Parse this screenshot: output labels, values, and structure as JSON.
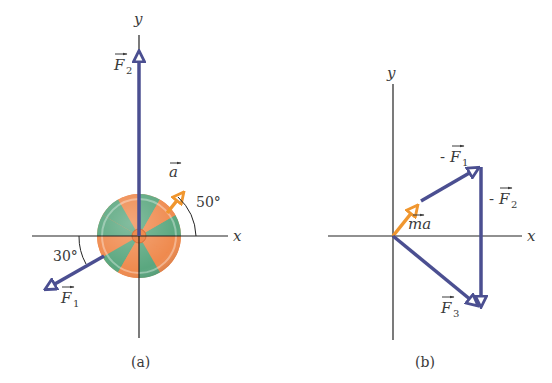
{
  "colors": {
    "force_vector": "#4b4f91",
    "acceleration_vector": "#f0962e",
    "axis": "#222222",
    "disk_green": "#5aa77f",
    "disk_orange": "#ef8a4e",
    "text": "#3a3a3a"
  },
  "panel_a": {
    "caption": "(a)",
    "axis_x_label": "x",
    "axis_y_label": "y",
    "vectors": {
      "F1": {
        "label": "F",
        "subscript": "1",
        "angle_label": "30°"
      },
      "F2": {
        "label": "F",
        "subscript": "2"
      },
      "a": {
        "label": "a",
        "angle_label": "50°"
      }
    }
  },
  "panel_b": {
    "caption": "(b)",
    "axis_x_label": "x",
    "axis_y_label": "y",
    "vectors": {
      "neg_F1": {
        "prefix": "-",
        "label": "F",
        "subscript": "1"
      },
      "neg_F2": {
        "prefix": "-",
        "label": "F",
        "subscript": "2"
      },
      "F3": {
        "label": "F",
        "subscript": "3"
      },
      "ma": {
        "label": "ma"
      }
    }
  }
}
